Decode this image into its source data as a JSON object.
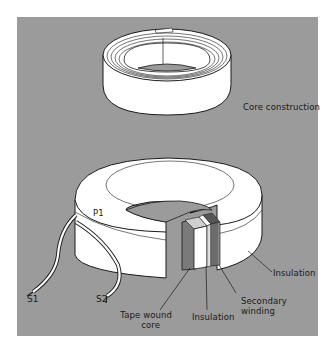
{
  "figure": {
    "background_color": "#9b9b9b",
    "fill_color": "#ffffff",
    "stroke_color": "#1a1a1a"
  },
  "top_core": {
    "caption": "Core construction"
  },
  "bottom_transformer": {
    "primary_label": "P1",
    "lead_labels": [
      "S1",
      "S2"
    ],
    "callouts": {
      "insulation_outer": "Insulation",
      "secondary_winding_line1": "Secondary",
      "secondary_winding_line2": "winding",
      "insulation_inner": "Insulation",
      "tape_wound_core_line1": "Tape wound",
      "tape_wound_core_line2": "core"
    }
  }
}
